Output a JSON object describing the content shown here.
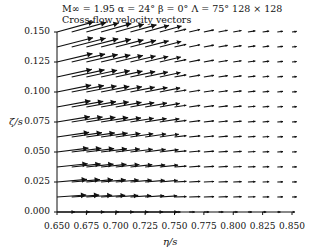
{
  "chart_data": {
    "type": "quiver",
    "subtitle": "Cross-flow velocity vectors",
    "xlabel": "η/s",
    "ylabel": "ζ/s",
    "xlim": [
      0.65,
      0.85
    ],
    "ylim": [
      0.0,
      0.15
    ],
    "xticks": [
      "0.650",
      "0.675",
      "0.700",
      "0.725",
      "0.750",
      "0.775",
      "0.800",
      "0.825",
      "0.850"
    ],
    "yticks": [
      "0.000",
      "0.025",
      "0.050",
      "0.075",
      "0.100",
      "0.125",
      "0.150"
    ],
    "grid": false,
    "legend": null,
    "vector_grid": {
      "eta_start": 0.65,
      "eta_step": 0.0125,
      "n_cols": 17,
      "zeta_start": 0.0,
      "zeta_step": 0.0125,
      "n_rows": 13,
      "description": "Large rightward vectors with upward tilt near left edge (eta 0.650-0.740), decaying to short nearly-horizontal vectors beyond eta 0.760; upward tilt increases with zeta"
    }
  },
  "text": {
    "title": "M∞ = 1.95   α = 24°   β = 0°   Λ = 75°   128 × 128",
    "subtitle": "Cross-flow velocity vectors",
    "xlabel": "η/s",
    "ylabel": "ζ/s",
    "xticks": [
      "0.650",
      "0.675",
      "0.700",
      "0.725",
      "0.750",
      "0.775",
      "0.800",
      "0.825",
      "0.850"
    ],
    "yticks": [
      "0.000",
      "0.025",
      "0.050",
      "0.075",
      "0.100",
      "0.125",
      "0.150"
    ]
  },
  "colors": {
    "ink": "#111111",
    "background": "#ffffff"
  }
}
